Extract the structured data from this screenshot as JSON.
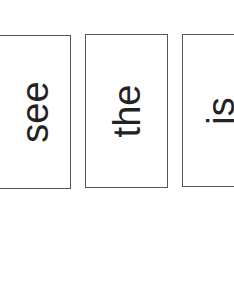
{
  "cards": [
    {
      "word": "see"
    },
    {
      "word": "the"
    },
    {
      "word": "is"
    }
  ]
}
